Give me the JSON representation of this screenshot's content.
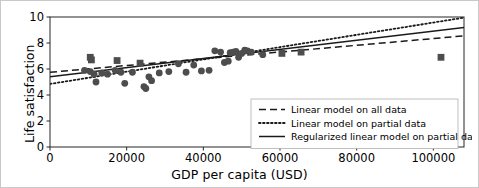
{
  "chart_data": {
    "type": "scatter",
    "title": "",
    "xlabel": "GDP per capita (USD)",
    "ylabel": "Life satisfaction",
    "xlim": [
      0,
      108000
    ],
    "ylim": [
      0,
      10
    ],
    "xticks": [
      0,
      20000,
      40000,
      60000,
      80000,
      100000
    ],
    "xticklabels": [
      "0",
      "20000",
      "40000",
      "60000",
      "80000",
      "100000"
    ],
    "yticks": [
      0,
      2,
      4,
      6,
      8,
      10
    ],
    "yticklabels": [
      "0",
      "2",
      "4",
      "6",
      "8",
      "10"
    ],
    "grid": false,
    "legend_position": "lower right",
    "marker_color": "#4d4d4d",
    "line_color": "#1a1a1a",
    "series": [
      {
        "name": "partial data",
        "marker": "circle",
        "points": [
          [
            9000,
            5.9
          ],
          [
            10500,
            5.8
          ],
          [
            11500,
            5.6
          ],
          [
            12000,
            5.0
          ],
          [
            13500,
            5.7
          ],
          [
            15000,
            5.6
          ],
          [
            17000,
            5.9
          ],
          [
            18500,
            5.75
          ],
          [
            19500,
            4.9
          ],
          [
            21500,
            5.75
          ],
          [
            24500,
            4.65
          ],
          [
            25000,
            4.5
          ],
          [
            25800,
            5.4
          ],
          [
            26500,
            5.1
          ],
          [
            28500,
            5.7
          ],
          [
            31000,
            5.8
          ],
          [
            33500,
            6.4
          ],
          [
            35500,
            5.75
          ],
          [
            37500,
            6.3
          ],
          [
            39500,
            5.85
          ],
          [
            41500,
            5.9
          ],
          [
            43000,
            7.4
          ],
          [
            44500,
            7.3
          ],
          [
            45500,
            6.5
          ],
          [
            46500,
            6.6
          ],
          [
            47000,
            7.25
          ],
          [
            47800,
            7.3
          ],
          [
            48500,
            7.35
          ],
          [
            49200,
            6.9
          ],
          [
            50000,
            7.2
          ],
          [
            50800,
            7.45
          ],
          [
            51500,
            7.4
          ],
          [
            52500,
            7.3
          ],
          [
            55500,
            7.1
          ]
        ]
      },
      {
        "name": "held-out data",
        "marker": "square",
        "points": [
          [
            10500,
            6.9
          ],
          [
            10800,
            6.7
          ],
          [
            17500,
            6.65
          ],
          [
            23500,
            6.45
          ],
          [
            60500,
            7.2
          ],
          [
            65500,
            7.3
          ],
          [
            102000,
            6.9
          ]
        ]
      }
    ],
    "lines": [
      {
        "name": "Linear model on all data",
        "style": "dashed",
        "x": [
          0,
          108000
        ],
        "y": [
          5.75,
          8.55
        ]
      },
      {
        "name": "Linear model on partial data",
        "style": "dotted",
        "x": [
          0,
          108000
        ],
        "y": [
          4.85,
          9.95
        ]
      },
      {
        "name": "Regularized linear model on partial data",
        "style": "solid",
        "x": [
          0,
          108000
        ],
        "y": [
          5.4,
          9.2
        ]
      }
    ]
  },
  "legend": {
    "entries": [
      {
        "label": "Linear model on all data",
        "style": "dashed"
      },
      {
        "label": "Linear model on partial data",
        "style": "dotted"
      },
      {
        "label": "Regularized linear model on partial data",
        "style": "solid"
      }
    ]
  }
}
